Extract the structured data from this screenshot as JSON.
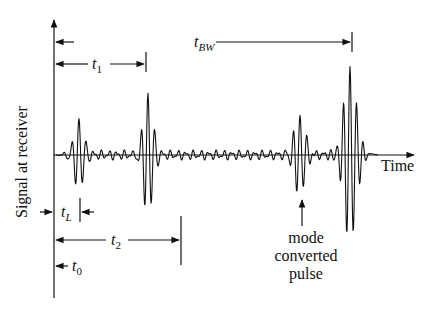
{
  "diagram": {
    "y_axis_label": "Signal at receiver",
    "x_axis_label": "Time",
    "annotations": {
      "t_BW": {
        "base": "t",
        "sub": "BW"
      },
      "t_1": {
        "base": "t",
        "sub": "1"
      },
      "t_2": {
        "base": "t",
        "sub": "2"
      },
      "t_L": {
        "base": "t",
        "sub": "L"
      },
      "t_0": {
        "base": "t",
        "sub": "0"
      }
    },
    "callout": {
      "line1": "mode",
      "line2": "converted",
      "line3": "pulse"
    }
  }
}
